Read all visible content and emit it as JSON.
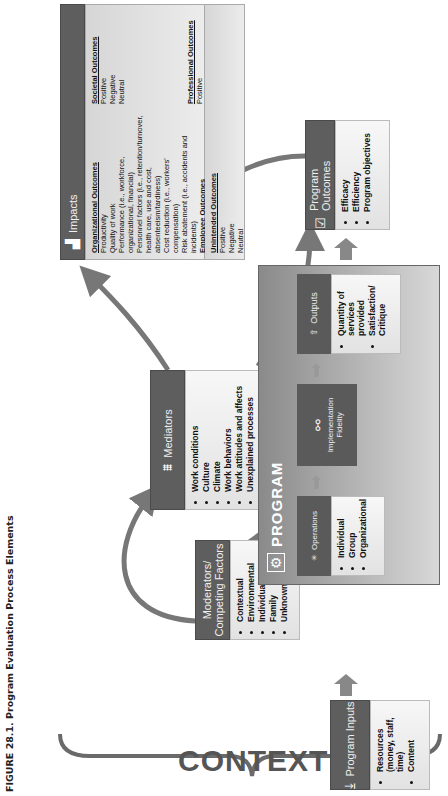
{
  "caption": "FIGURE 28.1.  Program Evaluation Process Elements",
  "context_label": "CONTEXT",
  "program_inputs": {
    "title": "Program Inputs",
    "icon": "arrow-down-tray-icon",
    "items": [
      "Resources (money, staff, time)",
      "Content"
    ]
  },
  "moderators": {
    "title": "Moderators/ Competing Factors",
    "items": [
      "Contextual",
      "Environmental",
      "Individual",
      "Family",
      "Unknown"
    ]
  },
  "mediators": {
    "title": "Mediators",
    "icon": "bridge-icon",
    "items": [
      "Work conditions",
      "Culture",
      "Climate",
      "Work behaviors",
      "Work attitudes and affects",
      "Unexplained processes"
    ]
  },
  "program": {
    "title": "PROGRAM",
    "icon": "program-icon",
    "operations": {
      "title": "Operations",
      "icon": "sparkle-icon",
      "items": [
        "Individual",
        "Group",
        "Organizational"
      ]
    },
    "fidelity": {
      "title": "Implementation Fidelity",
      "icon": "network-icon"
    },
    "outputs": {
      "title": "Outputs",
      "icon": "upload-icon",
      "items": [
        "Quantity of services provided",
        "Satisfaction/ Critique"
      ]
    }
  },
  "program_outcomes": {
    "title": "Program Outcomes",
    "icon": "clipboard-check-icon",
    "items": [
      "Efficacy",
      "Efficiency",
      "Program objectives"
    ]
  },
  "impacts": {
    "title": "Impacts",
    "icon": "bar-chart-icon",
    "organizational": {
      "heading": "Organizational Outcomes",
      "lines": [
        "Productivity",
        "Quality of work",
        "Performance (i.e., workforce,",
        "organizational, financial)",
        "Personnel factors (i.e., retention/turnover,",
        "health care, use and cost,",
        "absenteeism/tardiness)",
        "Cost reduction (i.e., workers'",
        "compensation)",
        "Risk abatement (i.e., accidents and incidents)"
      ]
    },
    "employee": {
      "heading": "Employee Outcomes",
      "lines": [
        "Health and well-being",
        "Quality of life (i.e., work, personal,",
        "work-family, interface)"
      ]
    },
    "unintended": {
      "heading": "Unintended Outcomes",
      "lines": [
        "Positive",
        "Negative",
        "Neutral"
      ]
    },
    "societal": {
      "heading": "Societal Outcomes",
      "lines": [
        "Positive",
        "Negative",
        "Neutral"
      ]
    },
    "professional": {
      "heading": "Professional Outcomes",
      "lines": [
        "Positive",
        "Negative",
        "Neutral"
      ]
    }
  },
  "colors": {
    "header_bg": "#5e5e5e",
    "list_bg": "#ececec",
    "arrow": "#777777"
  }
}
